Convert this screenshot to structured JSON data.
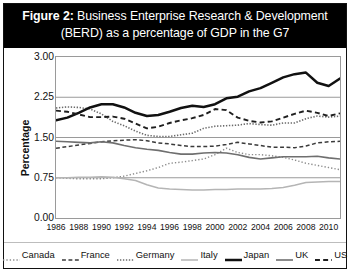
{
  "figure": {
    "label": "Figure 2:",
    "title_line1_rest": " Business Enterprise Research & Development",
    "title_line2": "(BERD) as a percentage of GDP in the G7"
  },
  "chart_data": {
    "type": "line",
    "title": "Figure 2: Business Enterprise Research & Development (BERD) as a percentage of GDP in the G7",
    "xlabel": "",
    "ylabel": "Percentage",
    "ylim": [
      0.0,
      3.0
    ],
    "yticks": [
      "0.00",
      "0.75",
      "1.50",
      "2.25",
      "3.00"
    ],
    "ytick_values": [
      0.0,
      0.75,
      1.5,
      2.25,
      3.0
    ],
    "xlim": [
      1986,
      2011
    ],
    "xticks": [
      "1986",
      "1988",
      "1990",
      "1992",
      "1994",
      "1996",
      "1998",
      "2000",
      "2002",
      "2004",
      "2006",
      "2008",
      "2010"
    ],
    "xtick_values": [
      1986,
      1988,
      1990,
      1992,
      1994,
      1996,
      1998,
      2000,
      2002,
      2004,
      2006,
      2008,
      2010
    ],
    "grid": true,
    "legend_position": "bottom",
    "x": [
      1986,
      1987,
      1988,
      1989,
      1990,
      1991,
      1992,
      1993,
      1994,
      1995,
      1996,
      1997,
      1998,
      1999,
      2000,
      2001,
      2002,
      2003,
      2004,
      2005,
      2006,
      2007,
      2008,
      2009,
      2010,
      2011
    ],
    "series": [
      {
        "name": "Canada",
        "color": "#8c8c8c",
        "style": "dotted",
        "width": 1.4,
        "values": [
          0.75,
          0.74,
          0.73,
          0.73,
          0.73,
          0.75,
          0.78,
          0.83,
          0.88,
          0.94,
          1.02,
          1.04,
          1.07,
          1.1,
          1.18,
          1.3,
          1.22,
          1.18,
          1.18,
          1.16,
          1.13,
          1.08,
          1.02,
          0.98,
          0.94,
          0.9
        ]
      },
      {
        "name": "France",
        "color": "#3a3a3a",
        "style": "dashed",
        "width": 1.5,
        "values": [
          1.3,
          1.33,
          1.36,
          1.39,
          1.42,
          1.44,
          1.45,
          1.46,
          1.44,
          1.4,
          1.38,
          1.35,
          1.33,
          1.33,
          1.34,
          1.37,
          1.41,
          1.38,
          1.35,
          1.32,
          1.32,
          1.31,
          1.34,
          1.4,
          1.42,
          1.43
        ]
      },
      {
        "name": "Germany",
        "color": "#6b6b6b",
        "style": "densedot",
        "width": 1.6,
        "values": [
          2.05,
          2.07,
          2.06,
          2.03,
          1.94,
          1.8,
          1.72,
          1.62,
          1.54,
          1.52,
          1.52,
          1.55,
          1.58,
          1.67,
          1.71,
          1.72,
          1.73,
          1.76,
          1.74,
          1.73,
          1.77,
          1.77,
          1.85,
          1.9,
          1.88,
          1.9
        ]
      },
      {
        "name": "Italy",
        "color": "#b5b5b5",
        "style": "solid",
        "width": 1.5,
        "values": [
          0.75,
          0.75,
          0.76,
          0.76,
          0.77,
          0.76,
          0.73,
          0.7,
          0.62,
          0.56,
          0.54,
          0.53,
          0.52,
          0.52,
          0.53,
          0.53,
          0.54,
          0.54,
          0.54,
          0.55,
          0.57,
          0.61,
          0.66,
          0.67,
          0.68,
          0.68
        ]
      },
      {
        "name": "Japan",
        "color": "#111111",
        "style": "solid",
        "width": 2.5,
        "values": [
          1.82,
          1.87,
          1.96,
          2.06,
          2.12,
          2.12,
          2.06,
          1.96,
          1.9,
          1.92,
          1.98,
          2.05,
          2.09,
          2.07,
          2.12,
          2.23,
          2.26,
          2.36,
          2.42,
          2.52,
          2.62,
          2.68,
          2.71,
          2.52,
          2.46,
          2.6
        ]
      },
      {
        "name": "UK",
        "color": "#6f6f6f",
        "style": "solid",
        "width": 1.6,
        "values": [
          1.43,
          1.42,
          1.41,
          1.4,
          1.42,
          1.4,
          1.35,
          1.31,
          1.28,
          1.26,
          1.22,
          1.19,
          1.19,
          1.21,
          1.22,
          1.21,
          1.18,
          1.13,
          1.1,
          1.12,
          1.14,
          1.14,
          1.14,
          1.15,
          1.12,
          1.1
        ]
      },
      {
        "name": "US",
        "color": "#1f1f1f",
        "style": "dashed",
        "width": 1.9,
        "values": [
          2.0,
          1.98,
          1.93,
          1.88,
          1.88,
          1.89,
          1.85,
          1.76,
          1.67,
          1.7,
          1.77,
          1.82,
          1.86,
          1.92,
          2.03,
          2.01,
          1.87,
          1.81,
          1.78,
          1.8,
          1.87,
          1.94,
          2.0,
          1.96,
          1.9,
          1.95
        ]
      }
    ]
  },
  "legend": {
    "items": [
      {
        "label": "Canada"
      },
      {
        "label": "France"
      },
      {
        "label": "Germany"
      },
      {
        "label": "Italy"
      },
      {
        "label": "Japan"
      },
      {
        "label": "UK"
      },
      {
        "label": "US"
      }
    ]
  }
}
